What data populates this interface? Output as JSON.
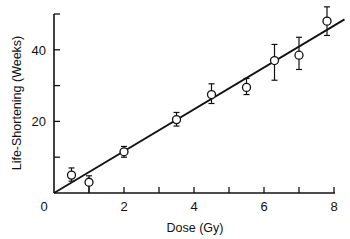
{
  "chart_data": {
    "type": "scatter",
    "title": "",
    "xlabel": "Dose (Gy)",
    "ylabel": "Life-Shortening (Weeks)",
    "xlim": [
      0,
      8
    ],
    "ylim": [
      0,
      50
    ],
    "x_ticks": [
      0,
      1,
      2,
      3,
      4,
      5,
      6,
      7,
      8
    ],
    "x_tick_labels": [
      "0",
      "2",
      "4",
      "6",
      "8"
    ],
    "x_tick_label_values": [
      0,
      2,
      4,
      6,
      8
    ],
    "y_ticks": [
      0,
      10,
      20,
      30,
      40,
      50
    ],
    "y_tick_labels": [
      "20",
      "40"
    ],
    "y_tick_label_values": [
      20,
      40
    ],
    "origin_label": "0",
    "grid": false,
    "series": [
      {
        "name": "Observed",
        "marker": "open-circle",
        "x": [
          0.5,
          1.0,
          2.0,
          3.5,
          4.5,
          5.5,
          6.3,
          7.0,
          7.8
        ],
        "y": [
          5.0,
          3.0,
          11.5,
          20.5,
          27.5,
          29.5,
          37.0,
          38.5,
          48.0
        ],
        "err_low": [
          3.3,
          0.0,
          10.0,
          18.7,
          25.0,
          27.5,
          31.5,
          34.5,
          44.0
        ],
        "err_high": [
          7.0,
          4.8,
          13.0,
          22.5,
          30.5,
          32.0,
          41.5,
          43.5,
          52.0
        ]
      },
      {
        "name": "Linear fit",
        "type": "line",
        "x": [
          0,
          8.3
        ],
        "y": [
          0,
          48.5
        ]
      }
    ]
  }
}
